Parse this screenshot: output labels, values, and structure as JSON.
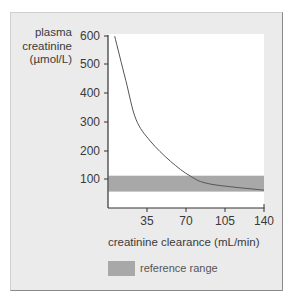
{
  "chart_data": {
    "type": "line",
    "title": "",
    "ylabel": "plasma creatinine (µmol/L)",
    "ylabel_lines": [
      "plasma",
      "creatinine",
      "(µmol/L)"
    ],
    "xlabel": "creatinine clearance (mL/min)",
    "xlim": [
      0,
      140
    ],
    "ylim": [
      0,
      600
    ],
    "x_ticks": [
      35,
      70,
      105,
      140
    ],
    "y_ticks": [
      100,
      200,
      300,
      400,
      500,
      600
    ],
    "grid": false,
    "series": [
      {
        "name": "plasma creatinine",
        "color": "#555555",
        "x": [
          6,
          16,
          25,
          38,
          56,
          74,
          92,
          140
        ],
        "y": [
          596,
          443,
          310,
          234,
          165,
          113,
          86,
          65
        ]
      }
    ],
    "bands": [
      {
        "name": "reference range",
        "ymin": 60,
        "ymax": 115,
        "color": "#a8a8a8"
      }
    ],
    "legend": {
      "position": "bottom",
      "entries": [
        "reference range"
      ]
    }
  },
  "labels": {
    "y1": "plasma",
    "y2": "creatinine",
    "y3": "(µmol/L)",
    "xtitle": "creatinine clearance (mL/min)",
    "legend": "reference range",
    "yt600": "600",
    "yt500": "500",
    "yt400": "400",
    "yt300": "300",
    "yt200": "200",
    "yt100": "100",
    "xt35": "35",
    "xt70": "70",
    "xt105": "105",
    "xt140": "140"
  }
}
